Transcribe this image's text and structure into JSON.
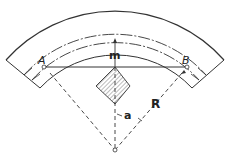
{
  "diagram": {
    "type": "curved-track-cross-section",
    "labels": {
      "point_a": "A",
      "point_b": "B",
      "midordinate": "m",
      "angle": "a",
      "radius": "R"
    },
    "colors": {
      "line": "#333333",
      "background": "#ffffff"
    }
  }
}
